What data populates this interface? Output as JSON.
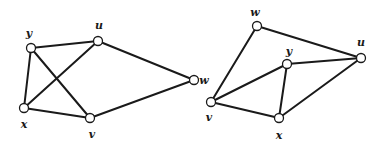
{
  "graphs": [
    {
      "name": "graph-left",
      "nodes": [
        {
          "id": "y",
          "label": "y",
          "x": 31,
          "y": 48,
          "lx": 29,
          "ly": 37
        },
        {
          "id": "u",
          "label": "u",
          "x": 98,
          "y": 41,
          "lx": 99,
          "ly": 29
        },
        {
          "id": "w",
          "label": "w",
          "x": 194,
          "y": 80,
          "lx": 204,
          "ly": 84
        },
        {
          "id": "x",
          "label": "x",
          "x": 24,
          "y": 108,
          "lx": 24,
          "ly": 128
        },
        {
          "id": "v",
          "label": "v",
          "x": 90,
          "y": 118,
          "lx": 92,
          "ly": 138
        }
      ],
      "edges": [
        [
          "y",
          "u"
        ],
        [
          "y",
          "x"
        ],
        [
          "y",
          "v"
        ],
        [
          "u",
          "x"
        ],
        [
          "u",
          "w"
        ],
        [
          "x",
          "v"
        ],
        [
          "v",
          "w"
        ]
      ]
    },
    {
      "name": "graph-right",
      "nodes": [
        {
          "id": "w",
          "label": "w",
          "x": 257,
          "y": 26,
          "lx": 255,
          "ly": 16
        },
        {
          "id": "u",
          "label": "u",
          "x": 361,
          "y": 58,
          "lx": 361,
          "ly": 46
        },
        {
          "id": "y",
          "label": "y",
          "x": 287,
          "y": 64,
          "lx": 289,
          "ly": 55
        },
        {
          "id": "v",
          "label": "v",
          "x": 211,
          "y": 102,
          "lx": 209,
          "ly": 121
        },
        {
          "id": "x",
          "label": "x",
          "x": 279,
          "y": 118,
          "lx": 279,
          "ly": 139
        }
      ],
      "edges": [
        [
          "w",
          "u"
        ],
        [
          "w",
          "v"
        ],
        [
          "y",
          "u"
        ],
        [
          "y",
          "v"
        ],
        [
          "y",
          "x"
        ],
        [
          "v",
          "x"
        ],
        [
          "x",
          "u"
        ]
      ]
    }
  ]
}
